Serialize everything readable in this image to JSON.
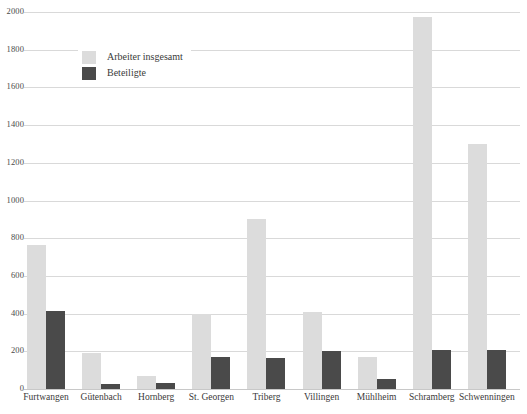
{
  "chart_data": {
    "type": "bar",
    "title": "",
    "xlabel": "",
    "ylabel": "",
    "ylim": [
      0,
      2000
    ],
    "ytick_step": 200,
    "grid": true,
    "legend_position": "top-left",
    "categories": [
      "Furtwangen",
      "Gütenbach",
      "Hornberg",
      "St. Georgen",
      "Triberg",
      "Villingen",
      "Mühlheim",
      "Schramberg",
      "Schwenningen"
    ],
    "yticks": [
      "0",
      "200",
      "400",
      "600",
      "800",
      "1000",
      "1200",
      "1400",
      "1600",
      "1800",
      "2000"
    ],
    "series": [
      {
        "name": "Arbeiter insgesamt",
        "color": "#dcdcdc",
        "values": [
          765,
          190,
          68,
          400,
          900,
          410,
          168,
          1975,
          1300
        ]
      },
      {
        "name": "Beteiligte",
        "color": "#4a4a4a",
        "values": [
          415,
          25,
          30,
          168,
          165,
          200,
          52,
          205,
          205
        ]
      }
    ]
  },
  "legend": {
    "items": [
      {
        "label": "Arbeiter insgesamt",
        "swatch": "total"
      },
      {
        "label": "Beteiligte",
        "swatch": "part"
      }
    ]
  },
  "colors": {
    "series_total": "#dcdcdc",
    "series_part": "#4a4a4a",
    "gridline": "#d9d9d9",
    "background": "#ffffff",
    "text": "#3a3a3a"
  }
}
